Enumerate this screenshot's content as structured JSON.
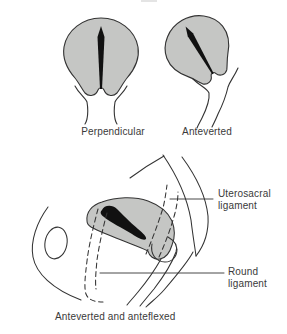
{
  "diagram": {
    "panels": [
      {
        "id": "perpendicular",
        "label": "Perpendicular"
      },
      {
        "id": "anteverted",
        "label": "Anteverted"
      },
      {
        "id": "anteverted_anteflexed",
        "label": "Anteverted and anteflexed"
      }
    ],
    "annotations": [
      {
        "id": "uterosacral_ligament",
        "line1": "Uterosacral",
        "line2": "ligament"
      },
      {
        "id": "round_ligament",
        "line1": "Round",
        "line2": "ligament"
      }
    ],
    "colors": {
      "background": "#ffffff",
      "uterus_fill": "#c5c6c4",
      "outline": "#333333",
      "cavity_fill": "#111111",
      "label_text": "#3a3a3a"
    }
  }
}
